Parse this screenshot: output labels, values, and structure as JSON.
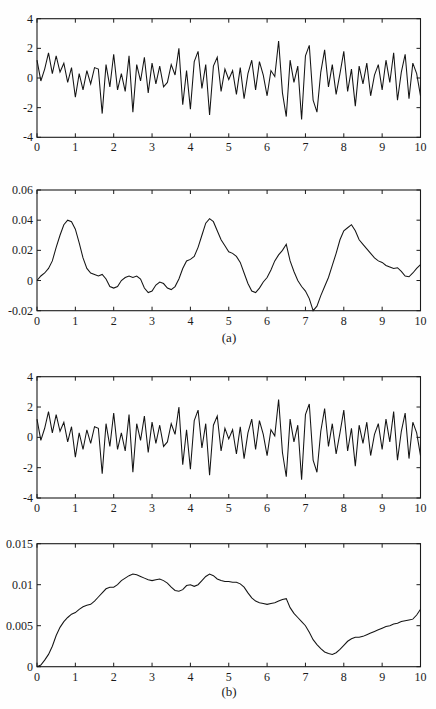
{
  "figure": {
    "background": "#fefefe",
    "axis_color": "#1b1b1b",
    "line_color": "#141414"
  },
  "chart_data": {
    "type": "line",
    "title": "",
    "xlabel": "",
    "ylabel": "",
    "grid": false,
    "legend": false,
    "xlim": [
      0,
      10
    ],
    "x_ticks": [
      0,
      1,
      2,
      3,
      4,
      5,
      6,
      7,
      8,
      9,
      10
    ],
    "x_tick_labels": [
      "0",
      "1",
      "2",
      "3",
      "4",
      "5",
      "6",
      "7",
      "8",
      "9",
      "10"
    ],
    "axis_color": "#1b1b1b",
    "line_color": "#141414",
    "panels": [
      {
        "id": "noisy-signal-a",
        "signal": "noise",
        "line_name": "noisy-signal-line",
        "ylim": [
          -4,
          4
        ],
        "y_ticks": [
          4,
          2,
          0,
          -2,
          -4
        ],
        "y_tick_labels": [
          "4",
          "2",
          "0",
          "-2",
          "-4"
        ],
        "sublabel": ""
      },
      {
        "id": "smooth-output-a",
        "signal": "envelope_a",
        "line_name": "smooth-output-line",
        "ylim": [
          -0.02,
          0.06
        ],
        "y_ticks": [
          0.06,
          0.04,
          0.02,
          0,
          -0.02
        ],
        "y_tick_labels": [
          "0.06",
          "0.04",
          "0.02",
          "0",
          "-0.02"
        ],
        "sublabel": "(a)"
      },
      {
        "id": "noisy-signal-b",
        "signal": "noise",
        "line_name": "noisy-signal-line",
        "ylim": [
          -4,
          4
        ],
        "y_ticks": [
          4,
          2,
          0,
          -2,
          -4
        ],
        "y_tick_labels": [
          "4",
          "2",
          "0",
          "-2",
          "-4"
        ],
        "sublabel": ""
      },
      {
        "id": "smooth-output-b",
        "signal": "envelope_b",
        "line_name": "smooth-output-line",
        "ylim": [
          0,
          0.015
        ],
        "y_ticks": [
          0.015,
          0.01,
          0.005,
          0
        ],
        "y_tick_labels": [
          "0.015",
          "0.01",
          "0.005",
          "0"
        ],
        "sublabel": "(b)"
      }
    ],
    "signals": {
      "noise": {
        "x_start": 0,
        "x_step": 0.1,
        "y": [
          1.2,
          -0.2,
          0.6,
          1.7,
          0.3,
          1.5,
          0.4,
          1.0,
          -0.3,
          0.7,
          -1.3,
          0.3,
          -0.8,
          0.5,
          -0.4,
          0.7,
          0.6,
          -2.4,
          0.9,
          -0.6,
          1.6,
          -0.8,
          0.3,
          -0.9,
          1.5,
          -2.3,
          0.9,
          -0.2,
          1.4,
          -1.0,
          1.0,
          -0.4,
          0.8,
          -0.6,
          -0.3,
          0.9,
          0.2,
          2.0,
          -1.8,
          0.5,
          -2.1,
          1.1,
          1.8,
          -0.7,
          0.9,
          -2.5,
          0.8,
          1.4,
          -0.9,
          0.6,
          -0.1,
          0.5,
          -1.1,
          0.7,
          -1.4,
          0.3,
          1.2,
          -0.8,
          1.1,
          0.2,
          -1.2,
          0.5,
          0.1,
          2.5,
          -1.0,
          -2.6,
          1.2,
          -0.3,
          0.8,
          -2.8,
          1.5,
          2.2,
          -1.5,
          -2.3,
          0.4,
          1.9,
          -0.6,
          0.9,
          -1.1,
          0.3,
          1.8,
          -0.9,
          0.6,
          -1.9,
          0.8,
          -0.4,
          1.0,
          -1.2,
          0.2,
          0.9,
          -0.8,
          1.2,
          -0.3,
          1.7,
          -1.5,
          0.4,
          1.6,
          -1.4,
          1.0,
          0.3,
          -1.2
        ]
      },
      "envelope_a": {
        "x_start": 0,
        "x_step": 0.1,
        "y": [
          0.0,
          0.003,
          0.005,
          0.008,
          0.013,
          0.022,
          0.03,
          0.037,
          0.04,
          0.039,
          0.034,
          0.025,
          0.015,
          0.008,
          0.005,
          0.004,
          0.003,
          0.004,
          0.001,
          -0.004,
          -0.005,
          -0.004,
          0.0,
          0.002,
          0.003,
          0.002,
          0.003,
          0.001,
          -0.005,
          -0.008,
          -0.007,
          -0.003,
          -0.001,
          -0.002,
          -0.005,
          -0.006,
          -0.004,
          0.001,
          0.008,
          0.013,
          0.014,
          0.016,
          0.022,
          0.03,
          0.038,
          0.041,
          0.039,
          0.033,
          0.027,
          0.023,
          0.019,
          0.018,
          0.016,
          0.012,
          0.005,
          -0.002,
          -0.007,
          -0.008,
          -0.005,
          -0.001,
          0.002,
          0.007,
          0.013,
          0.017,
          0.02,
          0.024,
          0.013,
          0.006,
          0.0,
          -0.004,
          -0.007,
          -0.012,
          -0.02,
          -0.017,
          -0.01,
          -0.004,
          0.002,
          0.01,
          0.018,
          0.027,
          0.033,
          0.035,
          0.037,
          0.033,
          0.027,
          0.024,
          0.021,
          0.018,
          0.015,
          0.013,
          0.012,
          0.01,
          0.009,
          0.008,
          0.0085,
          0.006,
          0.003,
          0.0025,
          0.005,
          0.008,
          0.0105
        ]
      },
      "envelope_b": {
        "x_start": 0,
        "x_step": 0.1,
        "y": [
          0.0,
          0.0002,
          0.0008,
          0.0015,
          0.0025,
          0.0038,
          0.0048,
          0.0055,
          0.006,
          0.0064,
          0.0066,
          0.007,
          0.0073,
          0.0075,
          0.0076,
          0.008,
          0.0085,
          0.009,
          0.0095,
          0.0097,
          0.0097,
          0.01,
          0.0105,
          0.0108,
          0.0111,
          0.0113,
          0.0112,
          0.011,
          0.0108,
          0.0106,
          0.0105,
          0.0106,
          0.0107,
          0.0105,
          0.0102,
          0.0097,
          0.0093,
          0.0092,
          0.0094,
          0.0099,
          0.01,
          0.0098,
          0.01,
          0.0105,
          0.011,
          0.0113,
          0.0111,
          0.0107,
          0.0105,
          0.0104,
          0.0104,
          0.0103,
          0.0103,
          0.0101,
          0.0097,
          0.009,
          0.0084,
          0.008,
          0.0078,
          0.0077,
          0.0076,
          0.0077,
          0.0078,
          0.008,
          0.0082,
          0.0083,
          0.0072,
          0.0065,
          0.006,
          0.0055,
          0.005,
          0.0042,
          0.0033,
          0.0027,
          0.0022,
          0.0018,
          0.0016,
          0.0015,
          0.0017,
          0.0021,
          0.0026,
          0.0031,
          0.0034,
          0.0036,
          0.0036,
          0.0037,
          0.0039,
          0.0041,
          0.0043,
          0.0045,
          0.0047,
          0.0049,
          0.005,
          0.0052,
          0.0053,
          0.0055,
          0.0056,
          0.0057,
          0.0058,
          0.0063,
          0.007
        ]
      }
    }
  }
}
